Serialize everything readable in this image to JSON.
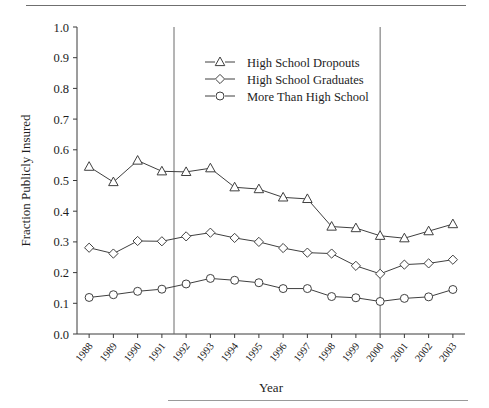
{
  "figure": {
    "axis_titles": {
      "x": "Year",
      "y": "Fraction Publicly Insured"
    }
  },
  "legend": {
    "position": "upper-center",
    "entries": [
      {
        "marker": "triangle",
        "label": "High  School Dropouts"
      },
      {
        "marker": "diamond",
        "label": "High School Graduates"
      },
      {
        "marker": "circle",
        "label": "More Than High School"
      }
    ]
  },
  "chart_data": {
    "type": "line",
    "title": "",
    "xlabel": "Year",
    "ylabel": "Fraction Publicly Insured",
    "categories": [
      "1988",
      "1989",
      "1990",
      "1991",
      "1992",
      "1993",
      "1994",
      "1995",
      "1996",
      "1997",
      "1998",
      "1999",
      "2000",
      "2001",
      "2002",
      "2003"
    ],
    "x": [
      1988,
      1989,
      1990,
      1991,
      1992,
      1993,
      1994,
      1995,
      1996,
      1997,
      1998,
      1999,
      2000,
      2001,
      2002,
      2003
    ],
    "ylim": [
      0.0,
      1.0
    ],
    "ytick_labels": [
      "0.0",
      "0.1",
      "0.2",
      "0.3",
      "0.4",
      "0.5",
      "0.6",
      "0.7",
      "0.8",
      "0.9",
      "1.0"
    ],
    "ytick_values": [
      0.0,
      0.1,
      0.2,
      0.3,
      0.4,
      0.5,
      0.6,
      0.7,
      0.8,
      0.9,
      1.0
    ],
    "grid": false,
    "legend_position": "upper-center",
    "annotations": [
      {
        "type": "vline",
        "x": 1991.5,
        "label": ""
      },
      {
        "type": "vline",
        "x": 2000.0,
        "label": ""
      }
    ],
    "series": [
      {
        "name": "High  School Dropouts",
        "marker": "triangle",
        "values": [
          0.545,
          0.495,
          0.565,
          0.53,
          0.528,
          0.54,
          0.478,
          0.472,
          0.445,
          0.44,
          0.35,
          0.345,
          0.32,
          0.312,
          0.335,
          0.358
        ]
      },
      {
        "name": "High School Graduates",
        "marker": "diamond",
        "values": [
          0.281,
          0.262,
          0.303,
          0.302,
          0.318,
          0.33,
          0.313,
          0.3,
          0.28,
          0.265,
          0.262,
          0.222,
          0.196,
          0.226,
          0.23,
          0.242
        ]
      },
      {
        "name": "More Than High School",
        "marker": "circle",
        "values": [
          0.119,
          0.128,
          0.139,
          0.146,
          0.163,
          0.181,
          0.175,
          0.167,
          0.148,
          0.148,
          0.122,
          0.118,
          0.106,
          0.116,
          0.121,
          0.145
        ]
      }
    ]
  }
}
